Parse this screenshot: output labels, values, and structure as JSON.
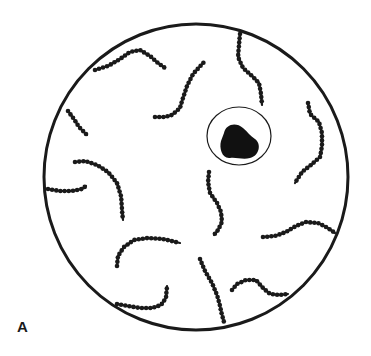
{
  "figure": {
    "panel_label": "A",
    "colors": {
      "ink": "#1a1a1a",
      "background": "#ffffff"
    },
    "field": {
      "cx": 196,
      "cy": 177,
      "rx": 152,
      "ry": 153
    },
    "cell": {
      "membrane": {
        "cx": 239,
        "cy": 136,
        "rx": 32,
        "ry": 29
      },
      "nucleus_path": "M224,133 C226,124 236,122 243,128 C248,132 250,136 255,139 C262,144 259,156 250,158 C243,160 236,157 230,158 C222,159 219,148 221,141 C222,138 223,136 224,133 Z"
    },
    "chains": [
      {
        "name": "chain-top-left",
        "points": [
          [
            95,
            70
          ],
          [
            108,
            66
          ],
          [
            120,
            59
          ],
          [
            130,
            52
          ],
          [
            140,
            50
          ],
          [
            150,
            56
          ],
          [
            158,
            63
          ],
          [
            165,
            68
          ]
        ]
      },
      {
        "name": "chain-top-center",
        "points": [
          [
            155,
            117
          ],
          [
            165,
            117
          ],
          [
            172,
            115
          ],
          [
            180,
            108
          ],
          [
            183,
            98
          ],
          [
            187,
            86
          ],
          [
            193,
            74
          ],
          [
            204,
            62
          ]
        ]
      },
      {
        "name": "chain-top-right",
        "points": [
          [
            240,
            34
          ],
          [
            239,
            45
          ],
          [
            238,
            57
          ],
          [
            243,
            68
          ],
          [
            252,
            76
          ],
          [
            259,
            83
          ],
          [
            261,
            94
          ],
          [
            262,
            105
          ]
        ]
      },
      {
        "name": "chain-right",
        "points": [
          [
            308,
            103
          ],
          [
            310,
            114
          ],
          [
            319,
            122
          ],
          [
            322,
            133
          ],
          [
            322,
            146
          ],
          [
            320,
            157
          ],
          [
            311,
            165
          ],
          [
            302,
            172
          ],
          [
            295,
            183
          ]
        ]
      },
      {
        "name": "chain-left-short",
        "points": [
          [
            68,
            111
          ],
          [
            74,
            119
          ],
          [
            79,
            127
          ],
          [
            87,
            135
          ]
        ]
      },
      {
        "name": "chain-left-curve",
        "points": [
          [
            75,
            162
          ],
          [
            85,
            161
          ],
          [
            97,
            165
          ],
          [
            108,
            172
          ],
          [
            117,
            183
          ],
          [
            121,
            196
          ],
          [
            122,
            210
          ],
          [
            123,
            220
          ]
        ]
      },
      {
        "name": "chain-left-edge",
        "points": [
          [
            48,
            189
          ],
          [
            60,
            191
          ],
          [
            72,
            191
          ],
          [
            82,
            189
          ],
          [
            86,
            186
          ]
        ]
      },
      {
        "name": "chain-center",
        "points": [
          [
            209,
            172
          ],
          [
            208,
            182
          ],
          [
            210,
            193
          ],
          [
            217,
            203
          ],
          [
            221,
            212
          ],
          [
            222,
            222
          ],
          [
            218,
            230
          ],
          [
            214,
            235
          ]
        ]
      },
      {
        "name": "chain-lower-left",
        "points": [
          [
            117,
            266
          ],
          [
            118,
            256
          ],
          [
            124,
            247
          ],
          [
            134,
            240
          ],
          [
            148,
            238
          ],
          [
            163,
            239
          ],
          [
            180,
            243
          ]
        ]
      },
      {
        "name": "chain-bottom-left",
        "points": [
          [
            117,
            304
          ],
          [
            128,
            306
          ],
          [
            140,
            308
          ],
          [
            152,
            308
          ],
          [
            161,
            305
          ],
          [
            166,
            298
          ],
          [
            167,
            286
          ]
        ]
      },
      {
        "name": "chain-bottom-center",
        "points": [
          [
            200,
            259
          ],
          [
            205,
            271
          ],
          [
            212,
            283
          ],
          [
            217,
            295
          ],
          [
            220,
            306
          ],
          [
            222,
            315
          ],
          [
            224,
            322
          ]
        ]
      },
      {
        "name": "chain-right-lower",
        "points": [
          [
            263,
            237
          ],
          [
            275,
            236
          ],
          [
            286,
            232
          ],
          [
            296,
            226
          ],
          [
            306,
            222
          ],
          [
            318,
            223
          ],
          [
            328,
            228
          ],
          [
            335,
            233
          ]
        ]
      },
      {
        "name": "chain-bottom-right",
        "points": [
          [
            232,
            290
          ],
          [
            237,
            284
          ],
          [
            246,
            280
          ],
          [
            256,
            280
          ],
          [
            263,
            288
          ],
          [
            270,
            294
          ],
          [
            280,
            295
          ],
          [
            288,
            294
          ]
        ]
      }
    ]
  }
}
